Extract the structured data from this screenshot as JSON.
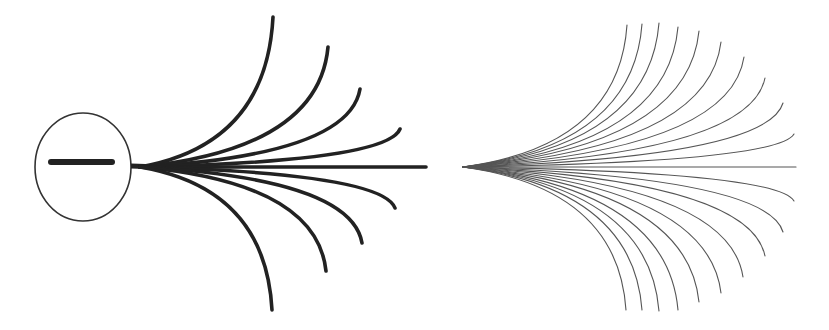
{
  "colors": {
    "background": "#ffffff",
    "thick_stroke": "#222222",
    "thin_stroke": "#555555"
  },
  "left_figure": {
    "circle": {
      "cx": 83,
      "cy": 167,
      "rx": 48,
      "ry": 54
    },
    "bar": {
      "x1": 51,
      "y1": 162,
      "x2": 112,
      "y2": 162
    },
    "stem": {
      "x1": 131,
      "y1": 166,
      "x2": 160,
      "y2": 167
    },
    "origin": [
      140,
      167
    ],
    "endpoints": [
      [
        273,
        17
      ],
      [
        328,
        47
      ],
      [
        360,
        89
      ],
      [
        400,
        129
      ],
      [
        426,
        167
      ],
      [
        395,
        208
      ],
      [
        362,
        243
      ],
      [
        326,
        271
      ],
      [
        272,
        310
      ]
    ]
  },
  "right_figure": {
    "apex": [
      463,
      167
    ],
    "endpoints": [
      [
        627,
        25
      ],
      [
        642,
        24
      ],
      [
        659,
        23
      ],
      [
        678,
        27
      ],
      [
        699,
        31
      ],
      [
        721,
        42
      ],
      [
        744,
        57
      ],
      [
        765,
        78
      ],
      [
        783,
        103
      ],
      [
        794,
        134
      ],
      [
        796,
        167
      ],
      [
        794,
        201
      ],
      [
        783,
        232
      ],
      [
        765,
        256
      ],
      [
        743,
        277
      ],
      [
        721,
        293
      ],
      [
        699,
        302
      ],
      [
        678,
        310
      ],
      [
        659,
        311
      ],
      [
        642,
        310
      ],
      [
        626,
        310
      ]
    ]
  }
}
